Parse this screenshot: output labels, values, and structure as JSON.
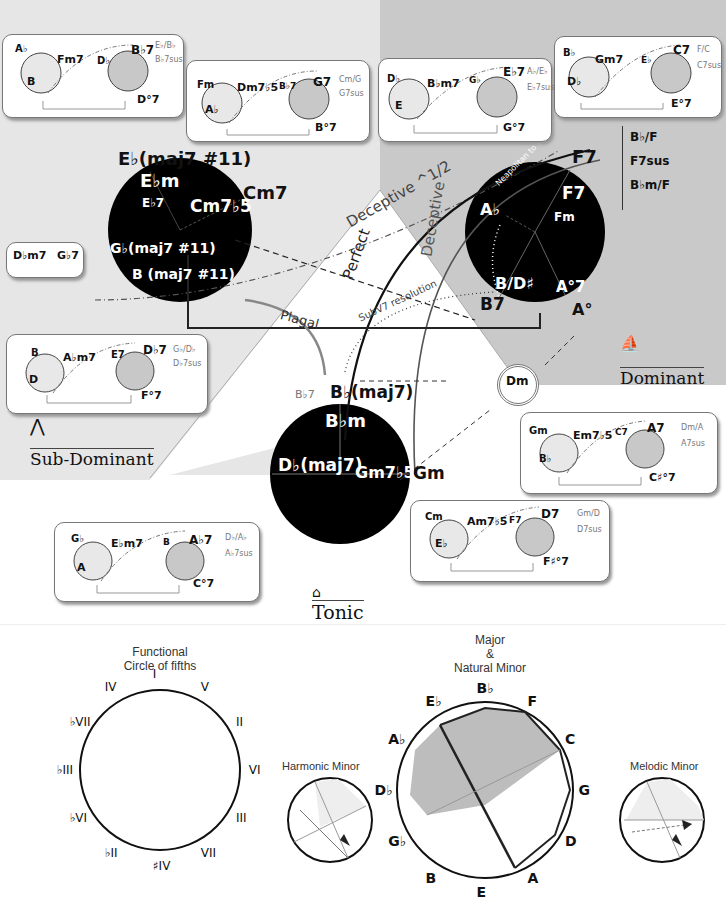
{
  "regions": {
    "subdominant": {
      "title": "Sub-Dominant",
      "icon": "tent-icon",
      "color": "#e4e4e4"
    },
    "dominant": {
      "title": "Dominant",
      "icon": "sailboat-icon",
      "color": "#c9c9c9"
    },
    "tonic": {
      "title": "Tonic",
      "icon": "house-icon",
      "color": "#ffffff"
    }
  },
  "main_wheels": {
    "subdominant": {
      "top": "E♭(maj7 #11)",
      "labels": [
        "E♭m",
        "E♭7",
        "Cm7♭5",
        "G♭(maj7 #11)",
        "B (maj7 #11)"
      ],
      "right": "Cm7"
    },
    "dominant": {
      "top": "F7",
      "labels": [
        "F7",
        "Fm",
        "A♭",
        "B/D♯",
        "A°7"
      ],
      "bottom_left": "B7",
      "bottom_right": "A°",
      "arc_label": "Neapolitan to V7"
    },
    "tonic": {
      "top": "B♭(maj7)",
      "left_small": "B♭7",
      "labels": [
        "B♭m",
        "D♭(maj7)",
        "Gm7♭5"
      ],
      "right": "Gm",
      "ring": "Dm"
    }
  },
  "cadences": {
    "deceptive_half": "Deceptive ^1/2",
    "perfect": "Perfect",
    "deceptive": "Deceptive",
    "plagal": "Plagal",
    "subv7": "SubV7 resolution"
  },
  "f7_substitutes": [
    "B♭/F",
    "F7sus",
    "B♭m/F"
  ],
  "cards": [
    {
      "id": "sd1",
      "left_top": "A♭",
      "left_right": "Fm7",
      "left_bottom": "B",
      "right_left": "D♭",
      "right_top": "B♭7",
      "right_bottom": "D°7",
      "subs": [
        "E♭/B♭",
        "B♭7sus"
      ]
    },
    {
      "id": "sd2",
      "left_top": "Fm",
      "left_right": "Dm7♭5",
      "left_bottom": "A♭",
      "right_left": "B♭7",
      "right_top": "G7",
      "right_bottom": "B°7",
      "subs": [
        "Cm/G",
        "G7sus"
      ]
    },
    {
      "id": "d1",
      "left_top": "D♭",
      "left_right": "B♭m7",
      "left_bottom": "E",
      "right_left": "G♭",
      "right_top": "E♭7",
      "right_bottom": "G°7",
      "subs": [
        "A♭/E♭",
        "E♭7sus"
      ]
    },
    {
      "id": "d2",
      "left_top": "B♭",
      "left_right": "Gm7",
      "left_bottom": "D♭",
      "right_left": "E♭",
      "right_top": "C7",
      "right_bottom": "E°7",
      "subs": [
        "F/C",
        "C7sus"
      ]
    },
    {
      "id": "sd3",
      "left_top": "B",
      "left_right": "A♭m7",
      "left_bottom": "D",
      "right_left": "E7",
      "right_top": "D♭7",
      "right_bottom": "F°7",
      "subs": [
        "G♭/D♭",
        "D♭7sus"
      ]
    },
    {
      "id": "t1",
      "left_top": "G♭",
      "left_right": "E♭m7",
      "left_bottom": "A",
      "right_left": "B",
      "right_top": "A♭7",
      "right_bottom": "C°7",
      "subs": [
        "D♭/A♭",
        "A♭7sus"
      ]
    },
    {
      "id": "t2",
      "left_top": "Cm",
      "left_right": "Am7♭5",
      "left_bottom": "E♭",
      "right_left": "F7",
      "right_top": "D7",
      "right_bottom": "F♯°7",
      "subs": [
        "Gm/D",
        "D7sus"
      ]
    },
    {
      "id": "t3",
      "left_top": "Gm",
      "left_right": "Em7♭5",
      "left_bottom": "B♭",
      "right_left": "C7",
      "right_top": "A7",
      "right_bottom": "C♯°7",
      "subs": [
        "Dm/A",
        "A7sus"
      ]
    }
  ],
  "small_card": {
    "left": "D♭m7",
    "right": "G♭7"
  },
  "bottom": {
    "functional": {
      "title_line1": "Functional",
      "title_line2": "Circle of fifths",
      "numerals": [
        "I",
        "V",
        "II",
        "VI",
        "III",
        "VII",
        "♯IV",
        "♭II",
        "♭VI",
        "♭III",
        "♭VII",
        "IV"
      ]
    },
    "harmonic": {
      "title": "Harmonic Minor",
      "notes": [
        "B♭",
        "F",
        "C",
        "G",
        "D",
        "A",
        "E",
        "B",
        "G♭",
        "D♭",
        "A♭",
        "E♭"
      ]
    },
    "major": {
      "title_line1": "Major",
      "title_line2": "&",
      "title_line3": "Natural Minor",
      "notes": [
        "B♭",
        "F",
        "C",
        "G",
        "D",
        "A",
        "E",
        "B",
        "G♭",
        "D♭",
        "A♭",
        "E♭"
      ]
    },
    "melodic": {
      "title": "Melodic Minor",
      "notes": [
        "B♭",
        "F",
        "C",
        "G",
        "D",
        "A",
        "E",
        "B",
        "G♭",
        "D♭",
        "A♭",
        "E♭"
      ]
    }
  }
}
